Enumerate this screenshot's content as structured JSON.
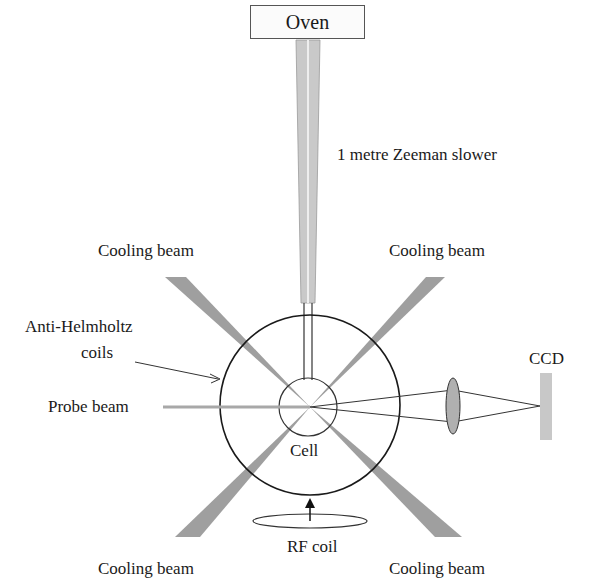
{
  "diagram": {
    "labels": {
      "oven": "Oven",
      "slower": "1 metre Zeeman slower",
      "cooling_beam_upper_left": "Cooling beam",
      "cooling_beam_upper_right": "Cooling beam",
      "cooling_beam_lower_left": "Cooling beam",
      "cooling_beam_lower_right": "Cooling beam",
      "coils": "Anti-Helmholtz",
      "coils_line2": "coils",
      "probe_beam": "Probe beam",
      "cell": "Cell",
      "ccd": "CCD",
      "rf_coil": "RF coil"
    },
    "colors": {
      "beam": "#9a9a9a",
      "tube": "#c8c8c8",
      "line": "#222222",
      "ccd": "#c8c8c8",
      "lens": "#b0b0b0"
    }
  }
}
